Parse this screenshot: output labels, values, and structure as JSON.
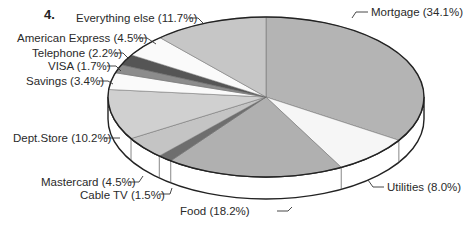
{
  "figure": {
    "number_label": "4."
  },
  "chart_data": {
    "type": "pie",
    "style": "3d-tilted",
    "title": "",
    "unit": "%",
    "categories": [
      "Mortgage",
      "Utilities",
      "Food",
      "Cable TV",
      "Mastercard",
      "Dept.Store",
      "Savings",
      "VISA",
      "Telephone",
      "American Express",
      "Everything else"
    ],
    "values": [
      34.1,
      8.0,
      18.2,
      1.5,
      4.5,
      10.2,
      3.4,
      1.7,
      2.2,
      4.5,
      11.7
    ],
    "labels": [
      "Mortgage (34.1%)",
      "Utilities (8.0%)",
      "Food (18.2%)",
      "Cable TV (1.5%)",
      "Mastercard (4.5%)",
      "Dept.Store (10.2%)",
      "Savings (3.4%)",
      "VISA (1.7%)",
      "Telephone (2.2%)",
      "American Express (4.5%)",
      "Everything else (11.7%)"
    ],
    "colors": [
      "#b4b4b4",
      "#f6f6f6",
      "#b0b0b0",
      "#6e6e6e",
      "#c4c4c4",
      "#d0d0d0",
      "#fafafa",
      "#8c8c8c",
      "#555555",
      "#fafafa",
      "#c6c6c6"
    ],
    "legend": "none (callout labels)",
    "grid": false
  }
}
